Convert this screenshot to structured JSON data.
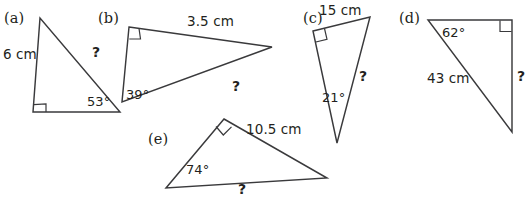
{
  "page": {
    "background_color": "#ffffff",
    "stroke_color": "#3a3a3c",
    "text_color": "#231f20",
    "unknown_symbol": "?"
  },
  "figures": [
    {
      "id": "a",
      "tag": "(a)",
      "tag_pos": {
        "x": 4,
        "y": 11
      },
      "vertices": {
        "apex": [
          40,
          18
        ],
        "right": [
          33,
          112
        ],
        "base_end": [
          120,
          112
        ]
      },
      "polygon_points": "40,18 33,112 120,112",
      "right_angle_mark": "46,112 46,104 33.6,104.6",
      "labels": [
        {
          "name": "side-length-label",
          "text": "6 cm",
          "kind": "meas",
          "x": 3,
          "y": 48
        },
        {
          "name": "angle-label",
          "text": "53°",
          "kind": "ang",
          "x": 87,
          "y": 95
        },
        {
          "name": "unknown-side-label",
          "text": "?",
          "kind": "unk",
          "x": 92,
          "y": 45
        }
      ]
    },
    {
      "id": "b",
      "tag": "(b)",
      "tag_pos": {
        "x": 98,
        "y": 11
      },
      "vertices": {
        "right_angle": [
          129,
          27
        ],
        "apex_right": [
          272,
          47
        ],
        "angle_vertex": [
          122,
          102
        ]
      },
      "polygon_points": "129,27 272,47 122,102",
      "right_angle_mark": "129.3,39 140.5,39 139,28.3",
      "labels": [
        {
          "name": "side-length-label",
          "text": "3.5 cm",
          "kind": "meas",
          "x": 187,
          "y": 15
        },
        {
          "name": "angle-label",
          "text": "39°",
          "kind": "ang",
          "x": 126,
          "y": 88
        },
        {
          "name": "unknown-side-label",
          "text": "?",
          "kind": "unk",
          "x": 232,
          "y": 79
        }
      ]
    },
    {
      "id": "c",
      "tag": "(c)",
      "tag_pos": {
        "x": 303,
        "y": 11
      },
      "vertices": {
        "right_angle": [
          313,
          31
        ],
        "top_right": [
          370,
          17
        ],
        "apex_bottom": [
          337,
          143
        ]
      },
      "polygon_points": "313,31 370,17 337,143",
      "right_angle_mark": "315.8,42 327,39.3 324.5,28.5",
      "labels": [
        {
          "name": "side-length-label",
          "text": "15 cm",
          "kind": "meas",
          "x": 319,
          "y": 4
        },
        {
          "name": "angle-label",
          "text": "21°",
          "kind": "ang",
          "x": 322,
          "y": 91
        },
        {
          "name": "unknown-side-label",
          "text": "?",
          "kind": "unk",
          "x": 359,
          "y": 69
        }
      ]
    },
    {
      "id": "d",
      "tag": "(d)",
      "tag_pos": {
        "x": 399,
        "y": 11
      },
      "vertices": {
        "angle_vertex": [
          428,
          20
        ],
        "right_angle": [
          512,
          20
        ],
        "bottom": [
          512,
          132
        ]
      },
      "polygon_points": "428,20 512,20 512,132",
      "right_angle_mark": "500,20.4 500,31.5 511.6,31.5",
      "labels": [
        {
          "name": "angle-label",
          "text": "62°",
          "kind": "ang",
          "x": 442,
          "y": 26
        },
        {
          "name": "side-length-label",
          "text": "43 cm",
          "kind": "meas",
          "x": 427,
          "y": 72
        },
        {
          "name": "unknown-side-label",
          "text": "?",
          "kind": "unk",
          "x": 517,
          "y": 69
        }
      ]
    },
    {
      "id": "e",
      "tag": "(e)",
      "tag_pos": {
        "x": 148,
        "y": 132
      },
      "vertices": {
        "right_angle": [
          224,
          119
        ],
        "right": [
          327,
          178
        ],
        "left_bottom": [
          166,
          188
        ]
      },
      "polygon_points": "224,119 327,178 166,188",
      "right_angle_mark": "216,126.5 223.3,135 231.5,126.8",
      "labels": [
        {
          "name": "side-length-label",
          "text": "10.5 cm",
          "kind": "meas",
          "x": 246,
          "y": 123
        },
        {
          "name": "angle-label",
          "text": "74°",
          "kind": "ang",
          "x": 186,
          "y": 163
        },
        {
          "name": "unknown-side-label",
          "text": "?",
          "kind": "unk",
          "x": 238,
          "y": 182
        }
      ]
    }
  ]
}
